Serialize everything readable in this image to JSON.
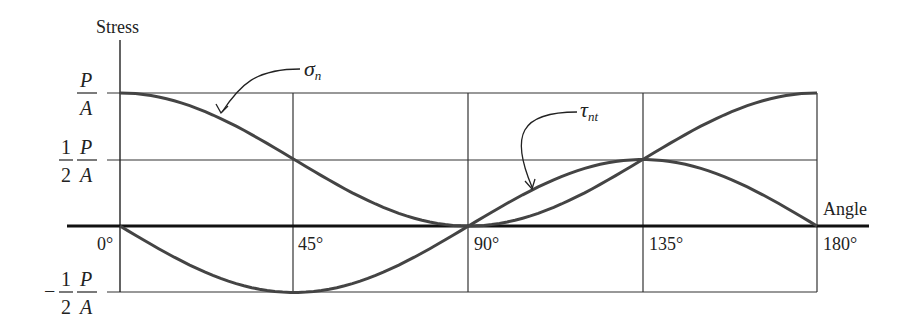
{
  "chart_data": {
    "type": "line",
    "title": "",
    "xlabel": "Angle",
    "ylabel": "Stress",
    "x_ticks": [
      "0°",
      "45°",
      "90°",
      "135°",
      "180°"
    ],
    "x": [
      0,
      45,
      90,
      135,
      180
    ],
    "y_ticks": [
      {
        "value": 1.0,
        "label_num": "P",
        "label_den": "A",
        "prefix": ""
      },
      {
        "value": 0.5,
        "label_num": "P",
        "label_den": "A",
        "prefix": "1/2"
      },
      {
        "value": -0.5,
        "label_num": "P",
        "label_den": "A",
        "prefix": "-1/2"
      }
    ],
    "y_unit": "P/A",
    "ylim": [
      -0.5,
      1.0
    ],
    "xlim": [
      0,
      180
    ],
    "grid": true,
    "series": [
      {
        "name": "σn",
        "label_main": "σ",
        "label_sub": "n",
        "formula": "(P/A) cos²θ",
        "values": [
          1.0,
          0.5,
          0.0,
          0.5,
          1.0
        ]
      },
      {
        "name": "τnt",
        "label_main": "τ",
        "label_sub": "nt",
        "formula": "-(P/2A) sin 2θ",
        "values": [
          0.0,
          -0.5,
          0.0,
          0.5,
          0.0
        ]
      }
    ]
  },
  "labels": {
    "y_axis": "Stress",
    "x_axis": "Angle",
    "tick_0": "0°",
    "tick_45": "45°",
    "tick_90": "90°",
    "tick_135": "135°",
    "tick_180": "180°",
    "frac_one": "1",
    "frac_two": "2",
    "frac_P": "P",
    "frac_A": "A",
    "minus": "−",
    "sigma_main": "σ",
    "sigma_sub": "n",
    "tau_main": "τ",
    "tau_sub": "nt"
  }
}
